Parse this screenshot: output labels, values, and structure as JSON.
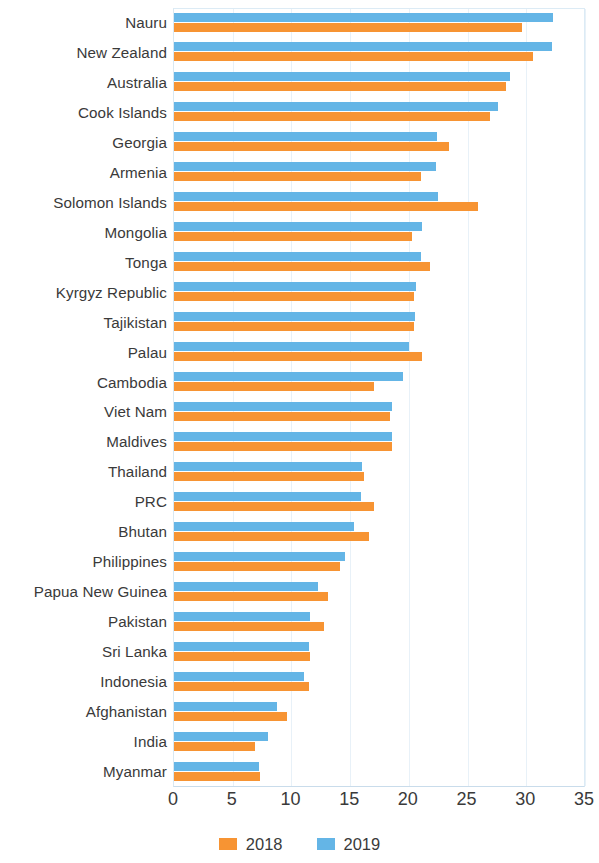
{
  "chart_data": {
    "type": "bar",
    "orientation": "horizontal",
    "title": "",
    "subtitle": "",
    "xlabel": "",
    "ylabel": "",
    "xlim": [
      0,
      35
    ],
    "xticks": [
      0,
      5,
      10,
      15,
      20,
      25,
      30,
      35
    ],
    "grid": true,
    "legend_position": "bottom-center",
    "categories": [
      "Nauru",
      "New Zealand",
      "Australia",
      "Cook Islands",
      "Georgia",
      "Armenia",
      "Solomon Islands",
      "Mongolia",
      "Tonga",
      "Kyrgyz Republic",
      "Tajikistan",
      "Palau",
      "Cambodia",
      "Viet Nam",
      "Maldives",
      "Thailand",
      "PRC",
      "Bhutan",
      "Philippines",
      "Papua New Guinea",
      "Pakistan",
      "Sri Lanka",
      "Indonesia",
      "Afghanistan",
      "India",
      "Myanmar"
    ],
    "series": [
      {
        "name": "2018",
        "color": "#f79433",
        "values": [
          29.6,
          30.6,
          28.3,
          26.9,
          23.4,
          21.0,
          25.9,
          20.3,
          21.8,
          20.4,
          20.4,
          21.1,
          17.0,
          18.4,
          18.6,
          16.2,
          17.0,
          16.6,
          14.1,
          13.1,
          12.8,
          11.6,
          11.5,
          9.6,
          6.9,
          7.3
        ]
      },
      {
        "name": "2019",
        "color": "#64b5e6",
        "values": [
          32.3,
          32.2,
          28.6,
          27.6,
          22.4,
          22.3,
          22.5,
          21.1,
          21.0,
          20.6,
          20.5,
          20.0,
          19.5,
          18.6,
          18.6,
          16.0,
          15.9,
          15.3,
          14.6,
          12.3,
          11.6,
          11.5,
          11.1,
          8.8,
          8.0,
          7.2
        ]
      }
    ]
  },
  "legend": {
    "items": [
      {
        "label": "2018",
        "color": "#f79433"
      },
      {
        "label": "2019",
        "color": "#64b5e6"
      }
    ]
  },
  "axis": {
    "x_tick_labels": [
      "0",
      "5",
      "10",
      "15",
      "20",
      "25",
      "30",
      "35"
    ]
  }
}
